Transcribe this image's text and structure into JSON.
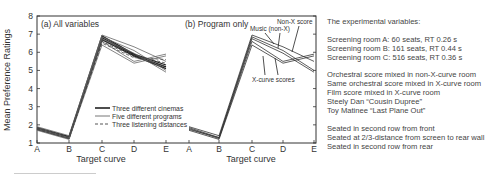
{
  "chart_data": [
    {
      "type": "line",
      "title": "(a) All variables",
      "xlabel": "Target curve",
      "ylabel": "Mean Preference Ratings",
      "categories": [
        "A",
        "B",
        "C",
        "D",
        "E"
      ],
      "ylim": [
        1,
        8
      ],
      "yticks": [
        1,
        2,
        3,
        4,
        5,
        6,
        7,
        8
      ],
      "grid": false,
      "legend_position": "lower right",
      "legend": [
        {
          "label": "Three different cinemas",
          "style": "solid-thick"
        },
        {
          "label": "Five different programs",
          "style": "solid-thin"
        },
        {
          "label": "Three listening distances",
          "style": "dashed"
        }
      ],
      "series": [
        {
          "name": "Cinema A",
          "group": "Three different cinemas",
          "values": [
            1.85,
            1.35,
            6.9,
            5.9,
            5.3
          ]
        },
        {
          "name": "Cinema B",
          "group": "Three different cinemas",
          "values": [
            1.75,
            1.25,
            6.8,
            5.85,
            5.2
          ]
        },
        {
          "name": "Cinema C",
          "group": "Three different cinemas",
          "values": [
            1.8,
            1.3,
            6.7,
            5.8,
            5.1
          ]
        },
        {
          "name": "Program 1",
          "group": "Five different programs",
          "values": [
            1.9,
            1.4,
            6.95,
            6.3,
            5.5
          ]
        },
        {
          "name": "Program 2",
          "group": "Five different programs",
          "values": [
            1.85,
            1.3,
            6.85,
            6.1,
            5.0
          ]
        },
        {
          "name": "Program 3",
          "group": "Five different programs",
          "values": [
            1.8,
            1.25,
            6.6,
            5.5,
            5.9
          ]
        },
        {
          "name": "Program 4",
          "group": "Five different programs",
          "values": [
            1.7,
            1.2,
            6.4,
            5.4,
            5.8
          ]
        },
        {
          "name": "Program 5",
          "group": "Five different programs",
          "values": [
            1.75,
            1.3,
            6.75,
            5.95,
            4.9
          ]
        },
        {
          "name": "Distance 1",
          "group": "Three listening distances",
          "values": [
            1.8,
            1.35,
            6.7,
            5.85,
            5.4
          ]
        },
        {
          "name": "Distance 2",
          "group": "Three listening distances",
          "values": [
            1.75,
            1.25,
            6.6,
            5.75,
            5.2
          ]
        },
        {
          "name": "Distance 3",
          "group": "Three listening distances",
          "values": [
            1.85,
            1.3,
            6.5,
            5.7,
            5.6
          ]
        }
      ]
    },
    {
      "type": "line",
      "title": "(b) Program only",
      "xlabel": "Target curve",
      "ylabel": "",
      "categories": [
        "A",
        "B",
        "C",
        "D",
        "E"
      ],
      "ylim": [
        1,
        8
      ],
      "grid": false,
      "annotations": [
        "Non-X score",
        "Music (non-X)",
        "X-curve scores"
      ],
      "series": [
        {
          "name": "Non-X score",
          "values": [
            1.9,
            1.4,
            6.95,
            6.3,
            5.5
          ]
        },
        {
          "name": "Music (non-X)",
          "values": [
            1.85,
            1.3,
            6.85,
            6.1,
            5.0
          ]
        },
        {
          "name": "Music (non-X) 2",
          "values": [
            1.75,
            1.3,
            6.75,
            5.95,
            4.9
          ]
        },
        {
          "name": "X-curve score 1",
          "values": [
            1.8,
            1.25,
            6.6,
            5.5,
            5.9
          ]
        },
        {
          "name": "X-curve score 2",
          "values": [
            1.7,
            1.2,
            6.4,
            5.4,
            5.8
          ]
        }
      ]
    }
  ],
  "panel_a": {
    "title": "(a) All variables",
    "legend": [
      "Three different cinemas",
      "Five different programs",
      "Three listening distances"
    ]
  },
  "panel_b": {
    "title": "(b) Program only",
    "annotation_nonx": "Non-X score",
    "annotation_music": "Music (non-X)",
    "annotation_xcurve": "X-curve scores"
  },
  "axes": {
    "ylabel": "Mean Preference Ratings",
    "xlabel": "Target curve",
    "yticks": [
      "1",
      "2",
      "3",
      "4",
      "5",
      "6",
      "7",
      "8"
    ],
    "xticks": [
      "A",
      "B",
      "C",
      "D",
      "E"
    ]
  },
  "variables": {
    "heading": "The experimental variables:",
    "rooms": [
      "Screening room A: 60 seats, RT 0.26 s",
      "Screening room B: 161 seats, RT 0.44 s",
      "Screening room C: 516 seats, RT 0.36 s"
    ],
    "programs": [
      "Orchestral score mixed in non-X-curve room",
      "Same orchestral score mixed in X-curve room",
      "Film score mixed in X-curve room",
      "Steely Dan “Cousin Dupree”",
      "Toy Matinee “Last Plane Out”"
    ],
    "seating": [
      "Seated in second row from front",
      "Seated at 2/3-distance from screen to rear wall",
      "Seated in second row from rear"
    ]
  }
}
